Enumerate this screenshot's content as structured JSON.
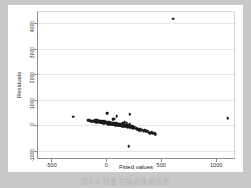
{
  "figure": {
    "caption": "图4-2  残差与拟合值散点图",
    "background": "#c8c8c8",
    "canvas_color": "#ffffff",
    "marker_color": "#1a1a1a",
    "grid_color": "#e6e6e6",
    "axis_color": "#8e8e8e"
  },
  "chart_data": {
    "type": "scatter",
    "title": "",
    "xlabel": "Fitted values",
    "ylabel": "Residuals",
    "xlim": [
      -620,
      1180
    ],
    "ylim": [
      -1320,
      4480
    ],
    "xticks": [
      -500,
      0,
      500,
      1000
    ],
    "xticklabels": [
      "-500",
      "0",
      "500",
      "1000"
    ],
    "yticks": [
      -1000,
      0,
      1000,
      2000,
      3000,
      4000
    ],
    "yticklabels": [
      "-1000",
      "0",
      "1000",
      "2000",
      "3000",
      "4000"
    ],
    "grid": "horizontal",
    "legend": "none",
    "series": [
      {
        "name": "residuals",
        "points": [
          [
            610,
            4180
          ],
          [
            1105,
            290
          ],
          [
            -300,
            330
          ],
          [
            10,
            480
          ],
          [
            95,
            360
          ],
          [
            215,
            430
          ],
          [
            215,
            55
          ],
          [
            205,
            -820
          ],
          [
            -140,
            165
          ],
          [
            -132,
            150
          ],
          [
            -125,
            185
          ],
          [
            -120,
            140
          ],
          [
            -112,
            175
          ],
          [
            -105,
            205
          ],
          [
            -100,
            150
          ],
          [
            -96,
            190
          ],
          [
            -92,
            130
          ],
          [
            -88,
            215
          ],
          [
            -84,
            160
          ],
          [
            -80,
            195
          ],
          [
            -76,
            120
          ],
          [
            -72,
            175
          ],
          [
            -68,
            140
          ],
          [
            -64,
            185
          ],
          [
            -60,
            105
          ],
          [
            -56,
            160
          ],
          [
            -52,
            130
          ],
          [
            -48,
            170
          ],
          [
            -44,
            95
          ],
          [
            -40,
            145
          ],
          [
            -36,
            115
          ],
          [
            -32,
            160
          ],
          [
            -28,
            85
          ],
          [
            -24,
            135
          ],
          [
            -20,
            105
          ],
          [
            -16,
            150
          ],
          [
            -12,
            75
          ],
          [
            -8,
            125
          ],
          [
            -4,
            95
          ],
          [
            0,
            140
          ],
          [
            4,
            60
          ],
          [
            8,
            110
          ],
          [
            12,
            80
          ],
          [
            16,
            125
          ],
          [
            20,
            50
          ],
          [
            24,
            100
          ],
          [
            28,
            70
          ],
          [
            32,
            115
          ],
          [
            36,
            40
          ],
          [
            40,
            90
          ],
          [
            44,
            60
          ],
          [
            48,
            105
          ],
          [
            52,
            30
          ],
          [
            56,
            80
          ],
          [
            60,
            50
          ],
          [
            64,
            95
          ],
          [
            68,
            20
          ],
          [
            72,
            70
          ],
          [
            76,
            40
          ],
          [
            80,
            85
          ],
          [
            84,
            10
          ],
          [
            88,
            60
          ],
          [
            92,
            30
          ],
          [
            96,
            75
          ],
          [
            100,
            0
          ],
          [
            104,
            50
          ],
          [
            108,
            20
          ],
          [
            112,
            65
          ],
          [
            116,
            -10
          ],
          [
            120,
            40
          ],
          [
            124,
            10
          ],
          [
            128,
            55
          ],
          [
            132,
            -20
          ],
          [
            136,
            30
          ],
          [
            140,
            0
          ],
          [
            144,
            45
          ],
          [
            148,
            -30
          ],
          [
            152,
            20
          ],
          [
            156,
            -10
          ],
          [
            160,
            35
          ],
          [
            164,
            -40
          ],
          [
            168,
            10
          ],
          [
            172,
            -20
          ],
          [
            176,
            25
          ],
          [
            180,
            -55
          ],
          [
            184,
            0
          ],
          [
            188,
            -30
          ],
          [
            192,
            15
          ],
          [
            196,
            -70
          ],
          [
            200,
            -15
          ],
          [
            204,
            -45
          ],
          [
            208,
            5
          ],
          [
            212,
            -85
          ],
          [
            216,
            -30
          ],
          [
            220,
            -60
          ],
          [
            224,
            -10
          ],
          [
            228,
            -100
          ],
          [
            232,
            -45
          ],
          [
            236,
            -75
          ],
          [
            240,
            -25
          ],
          [
            248,
            -115
          ],
          [
            254,
            -60
          ],
          [
            260,
            -95
          ],
          [
            268,
            -140
          ],
          [
            276,
            -110
          ],
          [
            284,
            -165
          ],
          [
            292,
            -130
          ],
          [
            300,
            -185
          ],
          [
            310,
            -155
          ],
          [
            320,
            -205
          ],
          [
            330,
            -175
          ],
          [
            340,
            -225
          ],
          [
            352,
            -195
          ],
          [
            364,
            -250
          ],
          [
            376,
            -220
          ],
          [
            388,
            -270
          ],
          [
            400,
            -300
          ],
          [
            412,
            -265
          ],
          [
            424,
            -320
          ],
          [
            436,
            -290
          ],
          [
            448,
            -340
          ],
          [
            140,
            55
          ],
          [
            155,
            95
          ],
          [
            170,
            130
          ],
          [
            185,
            75
          ],
          [
            62,
            230
          ],
          [
            75,
            265
          ],
          [
            -150,
            195
          ],
          [
            -158,
            175
          ],
          [
            -165,
            210
          ]
        ]
      }
    ]
  }
}
